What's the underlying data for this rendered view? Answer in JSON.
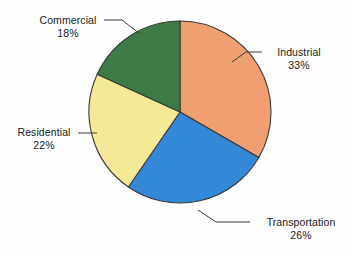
{
  "chart_data": {
    "type": "pie",
    "title": "",
    "categories": [
      "Industrial",
      "Transportation",
      "Residential",
      "Commercial"
    ],
    "values": [
      33,
      26,
      22,
      18
    ],
    "value_labels": [
      "33%",
      "26%",
      "22%",
      "18%"
    ],
    "unit": "%",
    "legend": "none",
    "labels_position": "outside-with-leader-lines",
    "start_angle_deg": 0,
    "direction": "clockwise",
    "slices": [
      {
        "name": "Industrial",
        "value": 33,
        "value_label": "33%",
        "color": "#f0a070",
        "start_angle_deg": 0,
        "end_angle_deg": 118.8
      },
      {
        "name": "Transportation",
        "value": 26,
        "value_label": "26%",
        "color": "#3388d8",
        "start_angle_deg": 118.8,
        "end_angle_deg": 212.4
      },
      {
        "name": "Residential",
        "value": 22,
        "value_label": "22%",
        "color": "#f5e896",
        "start_angle_deg": 212.4,
        "end_angle_deg": 291.6
      },
      {
        "name": "Commercial",
        "value": 18,
        "value_label": "18%",
        "color": "#3d7a46",
        "start_angle_deg": 291.6,
        "end_angle_deg": 360
      }
    ]
  },
  "colors": {
    "background": "#fdfdfd",
    "outline": "#3a3a3a",
    "text": "#1a1a1a",
    "leader_line": "#3a3a3a",
    "industrial": "#f0a070",
    "transportation": "#3388d8",
    "residential": "#f5e896",
    "commercial": "#3d7a46"
  },
  "labels": {
    "industrial": {
      "name": "Industrial",
      "percent": "33%"
    },
    "transportation": {
      "name": "Transportation",
      "percent": "26%"
    },
    "residential": {
      "name": "Residential",
      "percent": "22%"
    },
    "commercial": {
      "name": "Commercial",
      "percent": "18%"
    }
  }
}
